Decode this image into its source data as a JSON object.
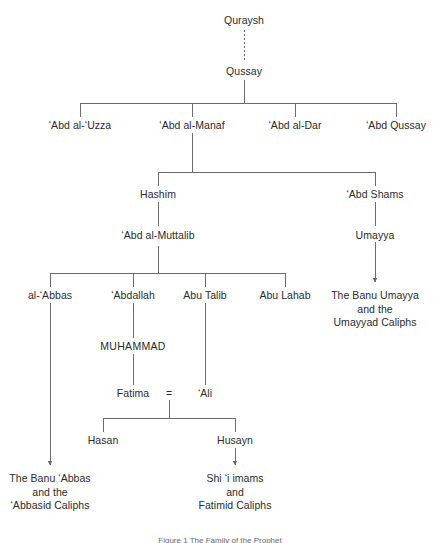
{
  "figure": {
    "title": "The Family of the Prophet",
    "caption": "Figure 1  The Family of the Prophet",
    "line_color": "#6b6b6b",
    "text_color": "#2b2b2b",
    "background": "#ffffff"
  },
  "nodes": {
    "quraysh": "Quraysh",
    "qussay": "Qussay",
    "abd_al_uzza": "ʻAbd al-ʻUzza",
    "abd_al_manaf": "ʻAbd al-Manaf",
    "abd_al_dar": "ʻAbd al-Dar",
    "abd_qussay": "ʻAbd Qussay",
    "hashim": "Hashim",
    "abd_shams": "ʻAbd Shams",
    "abd_al_muttalib": "ʻAbd al-Muttalib",
    "umayya": "Umayya",
    "al_abbas": "al-ʻAbbas",
    "abdallah": "ʻAbdallah",
    "abu_talib": "Abu Talib",
    "abu_lahab": "Abu Lahab",
    "muhammad": "MUHAMMAD",
    "fatima": "Fatima",
    "marriage_symbol": "=",
    "ali": "ʻAli",
    "hasan": "Hasan",
    "husayn": "Husayn",
    "banu_umayya_line1": "The Banu Umayya",
    "banu_umayya_line2": "and the",
    "banu_umayya_line3": "Umayyad Caliphs",
    "banu_abbas_line1": "The Banu ʻAbbas",
    "banu_abbas_line2": "and the",
    "banu_abbas_line3": "ʻAbbasid Caliphs",
    "shii_line1": "Shi ʻi imams",
    "shii_line2": "and",
    "shii_line3": "Fatimid Caliphs"
  }
}
